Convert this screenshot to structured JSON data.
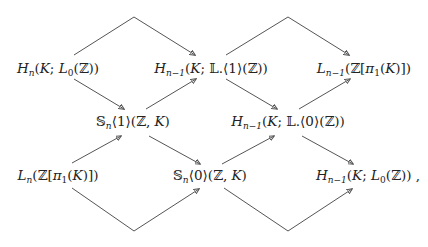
{
  "diagram": {
    "type": "commutative-braid-diagram",
    "nodes": {
      "hn_l0": {
        "label": "H_n(K; L_0(Z))",
        "x": 58,
        "y": 70
      },
      "hn1_l1": {
        "label": "H_{n-1}(K; L.<1>(Z))",
        "x": 211,
        "y": 70
      },
      "ln1_zpi": {
        "label": "L_{n-1}(Z[pi_1(K)])",
        "x": 364,
        "y": 70
      },
      "sn1": {
        "label": "S_n<1>(Z, K)",
        "x": 133,
        "y": 123
      },
      "hn1_l0dot": {
        "label": "H_{n-1}(K; L.<0>(Z))",
        "x": 288,
        "y": 123
      },
      "ln_zpi": {
        "label": "L_n(Z[pi_1(K)])",
        "x": 58,
        "y": 177
      },
      "sn0": {
        "label": "S_n<0>(Z, K)",
        "x": 210,
        "y": 177
      },
      "hn1_l0": {
        "label": "H_{n-1}(K; L_0(Z)) ,",
        "x": 366,
        "y": 177
      }
    },
    "edges": [
      {
        "from": "hn_l0",
        "to": "hn1_l1",
        "via": "top-arc-1"
      },
      {
        "from": "hn1_l1",
        "to": "ln1_zpi",
        "via": "top-arc-2"
      },
      {
        "from": "hn_l0",
        "to": "sn1"
      },
      {
        "from": "sn1",
        "to": "hn1_l1"
      },
      {
        "from": "hn1_l1",
        "to": "hn1_l0dot"
      },
      {
        "from": "hn1_l0dot",
        "to": "ln1_zpi"
      },
      {
        "from": "ln_zpi",
        "to": "sn1"
      },
      {
        "from": "sn1",
        "to": "sn0"
      },
      {
        "from": "sn0",
        "to": "hn1_l0dot"
      },
      {
        "from": "hn1_l0dot",
        "to": "hn1_l0"
      },
      {
        "from": "ln_zpi",
        "to": "sn0",
        "via": "bottom-arc-1"
      },
      {
        "from": "sn0",
        "to": "hn1_l0",
        "via": "bottom-arc-2"
      }
    ],
    "text": {
      "H": "H",
      "L": "L",
      "K": "K",
      "Z": "ℤ",
      "LL": "𝕃",
      "SS": "𝕊",
      "pi": "π",
      "n": "n",
      "n1": "n−1",
      "zero": "0",
      "one": "1",
      "semi": ";",
      "comma_trail": " ,"
    },
    "stroke_color": "#555555"
  }
}
